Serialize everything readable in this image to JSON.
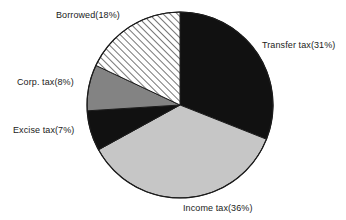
{
  "chart_data": {
    "type": "pie",
    "title": "",
    "subtitle": "",
    "xlabel": "",
    "ylabel": "",
    "legend_position": "none",
    "grid": false,
    "total_percent": 100,
    "start_angle_deg": 0,
    "direction": "clockwise",
    "categories": [
      "Transfer tax",
      "Income tax",
      "Excise tax",
      "Corp. tax",
      "Borrowed"
    ],
    "values": [
      31,
      36,
      7,
      8,
      18
    ],
    "slices": [
      {
        "name": "Transfer tax",
        "value": 31,
        "percent_text": "31%",
        "label": "Transfer tax(31%)",
        "fill": "#111111",
        "pattern": "solid",
        "start_deg": 0,
        "end_deg": 111.6,
        "label_side": "right"
      },
      {
        "name": "Income tax",
        "value": 36,
        "percent_text": "36%",
        "label": "Income tax(36%)",
        "fill": "#c6c6c6",
        "pattern": "solid",
        "start_deg": 111.6,
        "end_deg": 241.2,
        "label_side": "bottom"
      },
      {
        "name": "Excise tax",
        "value": 7,
        "percent_text": "7%",
        "label": "Excise tax(7%)",
        "fill": "#111111",
        "pattern": "solid",
        "start_deg": 241.2,
        "end_deg": 266.4,
        "label_side": "left"
      },
      {
        "name": "Corp. tax",
        "value": 8,
        "percent_text": "8%",
        "label": "Corp. tax(8%)",
        "fill": "#838383",
        "pattern": "solid",
        "start_deg": 266.4,
        "end_deg": 295.2,
        "label_side": "left"
      },
      {
        "name": "Borrowed",
        "value": 18,
        "percent_text": "18%",
        "label": "Borrowed(18%)",
        "fill": "#ffffff",
        "pattern": "diagonal-hatch",
        "start_deg": 295.2,
        "end_deg": 360,
        "label_side": "top-left"
      }
    ],
    "colors": {
      "black_slice": "#111111",
      "light_gray_slice": "#c6c6c6",
      "mid_gray_slice": "#838383",
      "hatch_background": "#ffffff",
      "hatch_line": "#2b2b2b",
      "outline": "#1c1c1c",
      "label_text": "#1a1a1a",
      "page_background": "#ffffff"
    },
    "geometry": {
      "center_x": 180,
      "center_y": 105,
      "radius": 93
    }
  }
}
